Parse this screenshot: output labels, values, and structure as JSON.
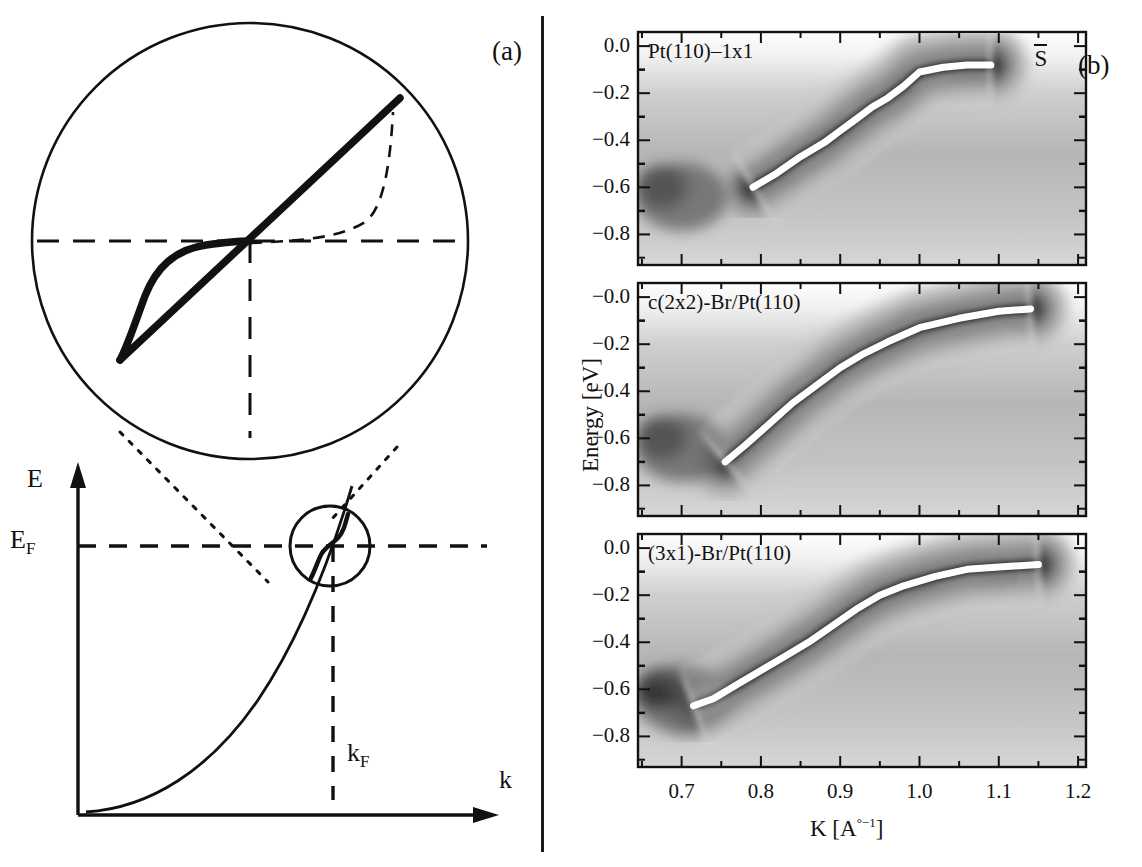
{
  "figure": {
    "panel_a_label": "(a)",
    "panel_b_label": "(b)"
  },
  "panel_a": {
    "name": "schematic-band-dispersion",
    "axis_y_label": "E",
    "fermi_label": "E",
    "fermi_sub": "F",
    "axis_x_label": "k",
    "kf_label": "k",
    "kf_sub": "F",
    "description": "Free-electron-like parabolic band crossing the Fermi level, with a circular magnification inset showing a kink in the dispersion near E_F"
  },
  "panel_b": {
    "name": "arpes-intensity-maps",
    "axis_y_title": "Energy [eV]",
    "axis_x_title_main": "K [A",
    "axis_x_title_sup": "°−1",
    "axis_x_title_close": "]",
    "symmetry_point": "S",
    "panels": [
      {
        "title": "Pt(110)–1x1",
        "yticks": [
          "0.0",
          "−0.2",
          "−0.4",
          "−0.6",
          "−0.8"
        ],
        "ytick_values": [
          0.0,
          -0.2,
          -0.4,
          -0.6,
          -0.8
        ]
      },
      {
        "title": "c(2x2)-Br/Pt(110)",
        "yticks": [
          "−0.0",
          "−0.2",
          "−0.4",
          "−0.6",
          "−0.8"
        ],
        "ytick_values": [
          0.0,
          -0.2,
          -0.4,
          -0.6,
          -0.8
        ]
      },
      {
        "title": "(3x1)-Br/Pt(110)",
        "yticks": [
          "0.0",
          "−0.2",
          "−0.4",
          "−0.6",
          "−0.8"
        ],
        "ytick_values": [
          0.0,
          -0.2,
          -0.4,
          -0.6,
          -0.8
        ]
      }
    ],
    "xticks": [
      "0.7",
      "0.8",
      "0.9",
      "1.0",
      "1.1",
      "1.2"
    ],
    "xtick_values": [
      0.7,
      0.8,
      0.9,
      1.0,
      1.1,
      1.2
    ],
    "xlim": [
      0.645,
      1.21
    ],
    "ylim": [
      -0.93,
      0.06
    ]
  },
  "chart_data": {
    "type": "heatmap",
    "xlabel": "K [A°−1]",
    "ylabel": "Energy [eV]",
    "xlim": [
      0.645,
      1.21
    ],
    "ylim": [
      -0.93,
      0.06
    ],
    "grid": false,
    "legend": "none",
    "colormap": "grayscale-inverted (dark = high intensity)",
    "overlay": "white contour lines of constant photoemission intensity, thick white line = extracted band dispersion",
    "annotation_symmetry_point": "S-bar",
    "panels": [
      {
        "name": "Pt(110)-1x1",
        "title": "Pt(110)–1x1",
        "dispersion": {
          "name": "band dispersion (thick white line)",
          "k": [
            0.79,
            0.82,
            0.85,
            0.88,
            0.9,
            0.92,
            0.94,
            0.96,
            0.98,
            1.0,
            1.03,
            1.06,
            1.09
          ],
          "E": [
            -0.6,
            -0.54,
            -0.47,
            -0.41,
            -0.36,
            -0.31,
            -0.26,
            -0.22,
            -0.17,
            -0.11,
            -0.09,
            -0.08,
            -0.08
          ]
        }
      },
      {
        "name": "c(2x2)-Br/Pt(110)",
        "title": "c(2x2)-Br/Pt(110)",
        "dispersion": {
          "name": "band dispersion (thick white line)",
          "k": [
            0.755,
            0.78,
            0.8,
            0.82,
            0.84,
            0.86,
            0.88,
            0.9,
            0.93,
            0.96,
            1.0,
            1.05,
            1.1,
            1.14
          ],
          "E": [
            -0.7,
            -0.63,
            -0.57,
            -0.51,
            -0.45,
            -0.4,
            -0.35,
            -0.3,
            -0.24,
            -0.19,
            -0.13,
            -0.09,
            -0.06,
            -0.05
          ]
        }
      },
      {
        "name": "(3x1)-Br/Pt(110)",
        "title": "(3x1)-Br/Pt(110)",
        "dispersion": {
          "name": "band dispersion (thick white line)",
          "k": [
            0.715,
            0.74,
            0.77,
            0.8,
            0.83,
            0.86,
            0.89,
            0.92,
            0.95,
            0.98,
            1.02,
            1.06,
            1.1,
            1.15
          ],
          "E": [
            -0.67,
            -0.64,
            -0.58,
            -0.52,
            -0.46,
            -0.4,
            -0.33,
            -0.26,
            -0.2,
            -0.16,
            -0.12,
            -0.09,
            -0.08,
            -0.07
          ]
        }
      }
    ]
  }
}
